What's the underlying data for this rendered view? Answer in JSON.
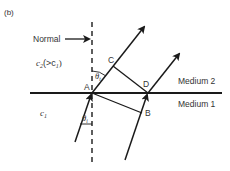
{
  "figure": {
    "panel_label": "(b)",
    "normal_label": "Normal",
    "medium_top_label": "Medium 2",
    "medium_bottom_label": "Medium 1",
    "speed_top": {
      "symbol": "c",
      "sub": "2",
      "suffix": "(>c",
      "suffix_sub": "1",
      "close": ")"
    },
    "speed_bottom": {
      "symbol": "c",
      "sub": "1"
    },
    "angle_top": {
      "symbol": "θ",
      "sub": "t"
    },
    "angle_bottom": {
      "symbol": "θ",
      "sub": "i"
    },
    "points": {
      "A": "A",
      "B": "B",
      "C": "C",
      "D": "D"
    },
    "colors": {
      "line": "#1a1a1a",
      "text": "#333333"
    }
  }
}
